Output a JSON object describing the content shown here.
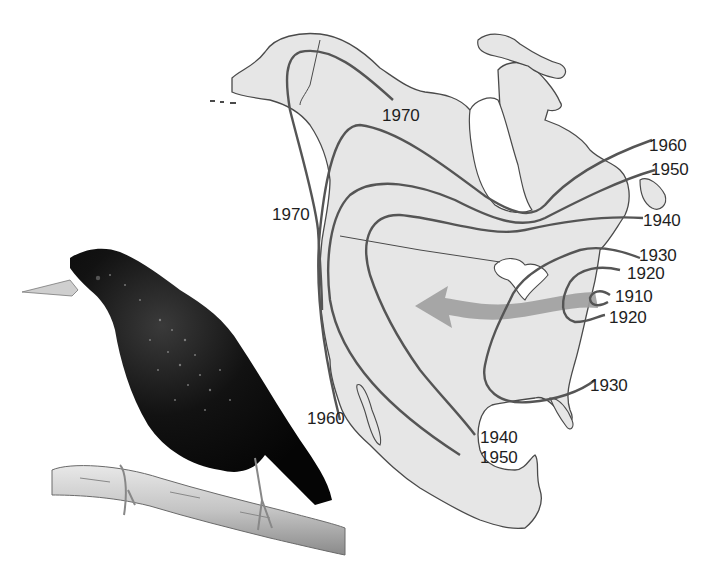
{
  "figure": {
    "colors": {
      "land": "#e6e6e6",
      "coastline": "#4a4a4a",
      "isoline": "#555555",
      "arrow": "#9e9e9e",
      "bird": "#0d0d0d",
      "branch": "#c8c8c8",
      "text": "#1e1e1e"
    }
  },
  "map": {
    "isolines": [
      {
        "year": "1910",
        "label": "1910"
      },
      {
        "year": "1920",
        "label": "1920"
      },
      {
        "year": "1930",
        "label": "1930"
      },
      {
        "year": "1940",
        "label": "1940"
      },
      {
        "year": "1950",
        "label": "1950"
      },
      {
        "year": "1960",
        "label": "1960"
      },
      {
        "year": "1970",
        "label": "1970"
      }
    ],
    "labels": {
      "l1970_north": "1970",
      "l1970_west": "1970",
      "l1960_east": "1960",
      "l1950_east": "1950",
      "l1940_east": "1940",
      "l1930_east": "1930",
      "l1920_east_upper": "1920",
      "l1910_east": "1910",
      "l1920_east_lower": "1920",
      "l1930_south": "1930",
      "l1960_west": "1960",
      "l1940_south": "1940",
      "l1950_south": "1950"
    },
    "arrow": {
      "direction": "east-to-west",
      "meaning": "direction of spread"
    }
  },
  "photo": {
    "subject": "European starling perched on branch"
  }
}
